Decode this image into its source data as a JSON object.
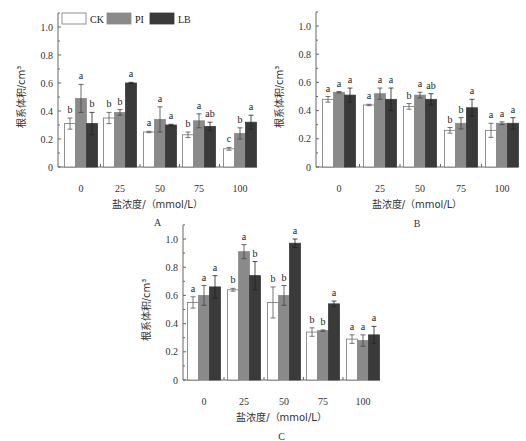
{
  "chart_data": [
    {
      "panel": "A",
      "type": "bar",
      "title": "",
      "xlabel": "盐浓度/（mmol/L）",
      "ylabel": "根系体积/cm³",
      "ylim": [
        0,
        1.1
      ],
      "yticks": [
        "0",
        "0.2",
        "0.4",
        "0.6",
        "0.8",
        "1.0"
      ],
      "categories": [
        "0",
        "25",
        "50",
        "75",
        "100"
      ],
      "legend": [
        "CK",
        "PI",
        "LB"
      ],
      "legend_position": "top-left",
      "series": [
        {
          "name": "CK",
          "values": [
            0.31,
            0.35,
            0.25,
            0.23,
            0.13
          ],
          "errors": [
            0.04,
            0.04,
            0.005,
            0.02,
            0.01
          ],
          "letters": [
            "b",
            "b",
            "a",
            "b",
            "c"
          ]
        },
        {
          "name": "PI",
          "values": [
            0.49,
            0.39,
            0.34,
            0.33,
            0.24
          ],
          "errors": [
            0.1,
            0.02,
            0.09,
            0.05,
            0.04
          ],
          "letters": [
            "a",
            "b",
            "a",
            "a",
            "b"
          ]
        },
        {
          "name": "LB",
          "values": [
            0.31,
            0.6,
            0.3,
            0.29,
            0.32
          ],
          "errors": [
            0.08,
            0.005,
            0.005,
            0.03,
            0.05
          ],
          "letters": [
            "b",
            "a",
            "a",
            "ab",
            "a"
          ]
        }
      ]
    },
    {
      "panel": "B",
      "type": "bar",
      "title": "",
      "xlabel": "盐浓度/（mmol/L）",
      "ylabel": "根系体积/cm³",
      "ylim": [
        0,
        1.1
      ],
      "yticks": [
        "0",
        "0.2",
        "0.4",
        "0.6",
        "0.8",
        "1.0"
      ],
      "categories": [
        "0",
        "25",
        "50",
        "75",
        "100"
      ],
      "legend": [
        "CK",
        "PI",
        "LB"
      ],
      "series": [
        {
          "name": "CK",
          "values": [
            0.48,
            0.44,
            0.43,
            0.26,
            0.26
          ],
          "errors": [
            0.02,
            0.005,
            0.02,
            0.02,
            0.05
          ],
          "letters": [
            "a",
            "a",
            "b",
            "b",
            "a"
          ]
        },
        {
          "name": "PI",
          "values": [
            0.53,
            0.52,
            0.51,
            0.31,
            0.31
          ],
          "errors": [
            0.005,
            0.04,
            0.02,
            0.04,
            0.01
          ],
          "letters": [
            "a",
            "a",
            "a",
            "b",
            "a"
          ]
        },
        {
          "name": "LB",
          "values": [
            0.51,
            0.48,
            0.48,
            0.42,
            0.31
          ],
          "errors": [
            0.05,
            0.08,
            0.04,
            0.06,
            0.04
          ],
          "letters": [
            "a",
            "a",
            "ab",
            "a",
            "a"
          ]
        }
      ]
    },
    {
      "panel": "C",
      "type": "bar",
      "title": "",
      "xlabel": "盐浓度/（mmol/L）",
      "ylabel": "根系体积/cm³",
      "ylim": [
        0,
        1.1
      ],
      "yticks": [
        "0",
        "0.2",
        "0.4",
        "0.6",
        "0.8",
        "1.0"
      ],
      "categories": [
        "0",
        "25",
        "50",
        "75",
        "100"
      ],
      "legend": [
        "CK",
        "PI",
        "LB"
      ],
      "series": [
        {
          "name": "CK",
          "values": [
            0.55,
            0.64,
            0.55,
            0.34,
            0.29
          ],
          "errors": [
            0.04,
            0.01,
            0.11,
            0.03,
            0.03
          ],
          "letters": [
            "a",
            "b",
            "b",
            "b",
            "a"
          ]
        },
        {
          "name": "PI",
          "values": [
            0.6,
            0.91,
            0.6,
            0.35,
            0.28
          ],
          "errors": [
            0.07,
            0.05,
            0.07,
            0.005,
            0.04
          ],
          "letters": [
            "a",
            "a",
            "b",
            "b",
            "a"
          ]
        },
        {
          "name": "LB",
          "values": [
            0.66,
            0.74,
            0.97,
            0.54,
            0.32
          ],
          "errors": [
            0.08,
            0.1,
            0.03,
            0.02,
            0.06
          ],
          "letters": [
            "a",
            "b",
            "a",
            "a",
            "a"
          ]
        }
      ]
    }
  ],
  "legend": {
    "items": [
      {
        "label": "CK",
        "color": "#ffffff"
      },
      {
        "label": "PI",
        "color": "#8a8a8a"
      },
      {
        "label": "LB",
        "color": "#3a3a3a"
      }
    ]
  },
  "colors": {
    "CK": "#ffffff",
    "PI": "#8a8a8a",
    "LB": "#3a3a3a",
    "axis": "#555555"
  },
  "panels": {
    "A": "A",
    "B": "B",
    "C": "C"
  },
  "axis": {
    "xlabel": "盐浓度/（mmol/L）",
    "ylabel": "根系体积/cm³"
  }
}
